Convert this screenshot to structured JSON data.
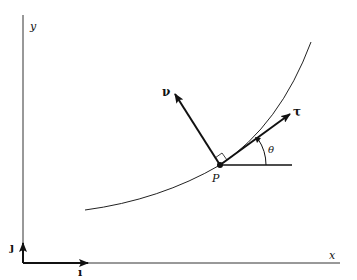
{
  "figure": {
    "axes": {
      "x_label": "x",
      "y_label": "y",
      "unit_x_label": "ı",
      "unit_y_label": "ȷ"
    },
    "point": {
      "label": "P"
    },
    "vectors": {
      "tangent_label": "τ",
      "normal_label": "ν"
    },
    "angle_label": "θ",
    "colors": {
      "ink": "#111111",
      "background": "#ffffff"
    }
  }
}
